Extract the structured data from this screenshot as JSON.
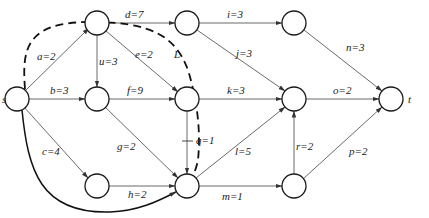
{
  "diagram": {
    "type": "network-graph",
    "nodes": [
      {
        "id": "s",
        "label": "s",
        "x": 17,
        "y": 99
      },
      {
        "id": "n1",
        "label": "",
        "x": 97,
        "y": 23
      },
      {
        "id": "n2",
        "label": "",
        "x": 97,
        "y": 99
      },
      {
        "id": "n3",
        "label": "",
        "x": 97,
        "y": 186
      },
      {
        "id": "n4",
        "label": "",
        "x": 187,
        "y": 23
      },
      {
        "id": "n5",
        "label": "",
        "x": 187,
        "y": 99
      },
      {
        "id": "n6",
        "label": "",
        "x": 187,
        "y": 186
      },
      {
        "id": "n7",
        "label": "",
        "x": 294,
        "y": 23
      },
      {
        "id": "n8",
        "label": "",
        "x": 294,
        "y": 99
      },
      {
        "id": "n9",
        "label": "",
        "x": 294,
        "y": 186
      },
      {
        "id": "t",
        "label": "t",
        "x": 391,
        "y": 99
      }
    ],
    "edges": [
      {
        "from": "s",
        "to": "n1",
        "label": "a=2"
      },
      {
        "from": "s",
        "to": "n2",
        "label": "b=3"
      },
      {
        "from": "s",
        "to": "n3",
        "label": "c=4"
      },
      {
        "from": "n1",
        "to": "n4",
        "label": "d=7"
      },
      {
        "from": "n1",
        "to": "n5",
        "label": "e=2"
      },
      {
        "from": "n2",
        "to": "n5",
        "label": "f=9"
      },
      {
        "from": "n2",
        "to": "n6",
        "label": "g=2"
      },
      {
        "from": "n3",
        "to": "n6",
        "label": "h=2"
      },
      {
        "from": "n4",
        "to": "n7",
        "label": "i=3"
      },
      {
        "from": "n4",
        "to": "n8",
        "label": "j=3"
      },
      {
        "from": "n5",
        "to": "n8",
        "label": "k=3"
      },
      {
        "from": "n6",
        "to": "n8",
        "label": "l=5"
      },
      {
        "from": "n6",
        "to": "n9",
        "label": "m=1"
      },
      {
        "from": "n7",
        "to": "t",
        "label": "n=3"
      },
      {
        "from": "n8",
        "to": "t",
        "label": "o=2"
      },
      {
        "from": "n9",
        "to": "t",
        "label": "p=2"
      },
      {
        "from": "n5",
        "to": "n6",
        "label": "q=1"
      },
      {
        "from": "n9",
        "to": "n8",
        "label": "r=2"
      },
      {
        "from": "n1",
        "to": "n2",
        "label": "u=3"
      },
      {
        "from": "s",
        "to": "n6",
        "label": "",
        "style": "bold-curve"
      }
    ],
    "cut_line": {
      "label": "L",
      "style": "dashed"
    }
  }
}
